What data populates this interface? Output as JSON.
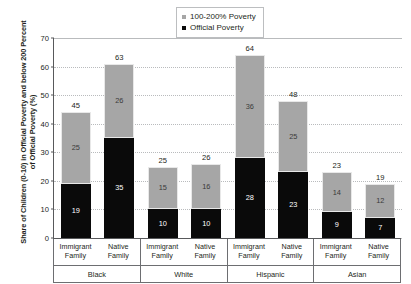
{
  "chart_data": {
    "type": "bar",
    "subtype": "stacked-bar-grouped",
    "title": "",
    "xlabel": "",
    "ylabel": "Share of Children (0-10) in Official Poverty and below 200 Percent of Official Poverty (%)",
    "ylim": [
      0,
      70
    ],
    "ytick_step": 10,
    "yticks": [
      0,
      10,
      20,
      30,
      40,
      50,
      60,
      70
    ],
    "ytick_labels": [
      "0",
      "10",
      "20",
      "30",
      "40",
      "50",
      "60",
      "70"
    ],
    "grid": true,
    "grid_axis": "y",
    "legend_position": "top-center",
    "groups": [
      "Black",
      "White",
      "Hispanic",
      "Asian"
    ],
    "subcategories": [
      "Immigrant Family",
      "Native Family"
    ],
    "categories": [
      "Black / Immigrant Family",
      "Black / Native Family",
      "White / Immigrant Family",
      "White / Native Family",
      "Hispanic / Immigrant Family",
      "Hispanic / Native Family",
      "Asian / Immigrant Family",
      "Asian / Native Family"
    ],
    "series": [
      {
        "name": "Official Poverty",
        "color": "#0a0a0a",
        "values": [
          19,
          35,
          10,
          10,
          28,
          23,
          9,
          7
        ]
      },
      {
        "name": "100-200% Poverty",
        "color": "#a6a6a6",
        "values": [
          25,
          26,
          15,
          16,
          36,
          25,
          14,
          12
        ]
      }
    ],
    "totals": [
      45,
      63,
      25,
      26,
      64,
      48,
      23,
      19
    ]
  },
  "legend": {
    "items": [
      {
        "label": "100-200% Poverty",
        "color": "#a6a6a6"
      },
      {
        "label": "Official Poverty",
        "color": "#0a0a0a"
      }
    ]
  },
  "axis": {
    "y_title": "Share of Children (0-10) in Official Poverty and below 200 Percent of Official Poverty (%)"
  }
}
